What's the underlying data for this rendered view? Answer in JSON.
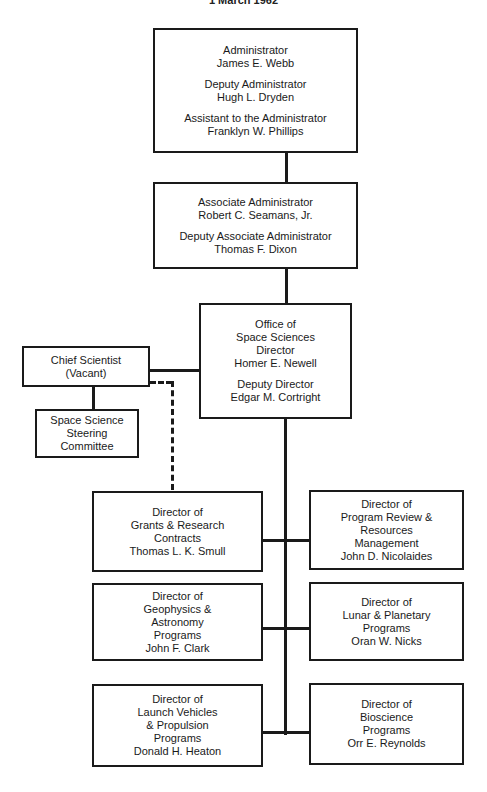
{
  "chart": {
    "date": "1 March 1962",
    "boxes": {
      "administrator": {
        "groups": [
          {
            "title": "Administrator",
            "name": "James E. Webb"
          },
          {
            "title": "Deputy Administrator",
            "name": "Hugh L. Dryden"
          },
          {
            "title": "Assistant to the Administrator",
            "name": "Franklyn W. Phillips"
          }
        ]
      },
      "associate_administrator": {
        "groups": [
          {
            "title": "Associate Administrator",
            "name": "Robert C. Seamans, Jr."
          },
          {
            "title": "Deputy Associate Administrator",
            "name": "Thomas F. Dixon"
          }
        ]
      },
      "office_space_sciences": {
        "lines": [
          "Office of",
          "Space Sciences",
          "Director",
          "Homer E. Newell"
        ],
        "deputy_title": "Deputy Director",
        "deputy_name": "Edgar M. Cortright"
      },
      "chief_scientist": {
        "lines": [
          "Chief Scientist",
          "(Vacant)"
        ]
      },
      "steering_committee": {
        "lines": [
          "Space Science",
          "Steering",
          "Committee"
        ]
      },
      "grants": {
        "lines": [
          "Director of",
          "Grants & Research",
          "Contracts",
          "Thomas L. K. Smull"
        ]
      },
      "program_review": {
        "lines": [
          "Director of",
          "Program Review &",
          "Resources",
          "Management",
          "John D. Nicolaides"
        ]
      },
      "geophysics": {
        "lines": [
          "Director of",
          "Geophysics &",
          "Astronomy",
          "Programs",
          "John F. Clark"
        ]
      },
      "lunar_planetary": {
        "lines": [
          "Director of",
          "Lunar & Planetary",
          "Programs",
          "Oran W. Nicks"
        ]
      },
      "launch_vehicles": {
        "lines": [
          "Director of",
          "Launch Vehicles",
          "& Propulsion",
          "Programs",
          "Donald H. Heaton"
        ]
      },
      "bioscience": {
        "lines": [
          "Director of",
          "Bioscience",
          "Programs",
          "Orr E. Reynolds"
        ]
      }
    }
  }
}
